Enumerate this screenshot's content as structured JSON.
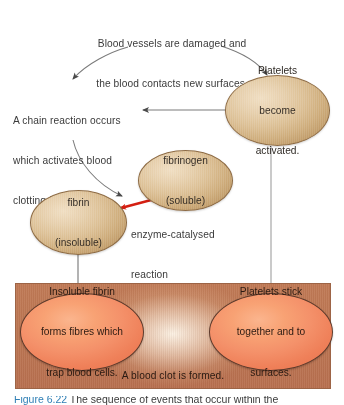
{
  "figure": {
    "background_color": "#ffffff"
  },
  "colors": {
    "tan_blob_fill": "#dcc096",
    "tan_blob_stroke": "#8d6b45",
    "orange_blob_fill": "#f4916a",
    "orange_blob_stroke": "#5d3a2b",
    "clot_box_fill": "#bd7753",
    "arrow_grey": "#6e6e6e",
    "arrow_red": "#d41f12",
    "text_color": "#3b3b3b",
    "caption_accent": "#2f7fb5"
  },
  "top_text": {
    "line1": "Blood vessels are damaged and",
    "line2": "the blood contacts new surfaces."
  },
  "chain_text": {
    "line1": "A chain reaction occurs",
    "line2": "which activates blood",
    "line3": "clotting factors."
  },
  "enzyme_label": {
    "line1": "enzyme-catalysed",
    "line2": "reaction"
  },
  "nodes": [
    {
      "id": "platelets-activated",
      "shape": "ellipse",
      "fill": "tan",
      "lines": [
        "Platelets",
        "become",
        "activated."
      ]
    },
    {
      "id": "fibrinogen",
      "shape": "ellipse",
      "fill": "tan",
      "lines": [
        "fibrinogen",
        "(soluble)"
      ]
    },
    {
      "id": "fibrin",
      "shape": "ellipse",
      "fill": "tan",
      "lines": [
        "fibrin",
        "(insoluble)"
      ]
    },
    {
      "id": "insoluble-fibrin-traps",
      "shape": "ellipse",
      "fill": "orange",
      "lines": [
        "Insoluble fibrin",
        "forms fibres which",
        "trap blood cells."
      ]
    },
    {
      "id": "platelets-stick",
      "shape": "ellipse",
      "fill": "orange",
      "lines": [
        "Platelets stick",
        "together and to",
        "surfaces."
      ]
    }
  ],
  "clot_box": {
    "footer_text": "A blood clot is formed."
  },
  "caption": {
    "label": "Figure 6.22",
    "text": "The sequence of events that occur within the"
  }
}
